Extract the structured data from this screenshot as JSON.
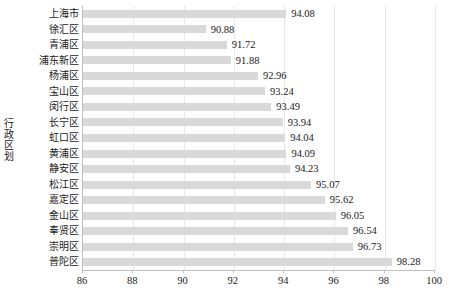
{
  "chart_data": {
    "type": "bar",
    "orientation": "horizontal",
    "title": "",
    "xlabel": "",
    "ylabel": "行政区划",
    "xlim": [
      86,
      100
    ],
    "xticks": [
      86,
      88,
      90,
      92,
      94,
      96,
      98,
      100
    ],
    "grid": true,
    "legend": null,
    "bar_color": "#d9d9d9",
    "categories": [
      "上海市",
      "徐汇区",
      "青浦区",
      "浦东新区",
      "杨浦区",
      "宝山区",
      "闵行区",
      "长宁区",
      "虹口区",
      "黄浦区",
      "静安区",
      "松江区",
      "嘉定区",
      "金山区",
      "奉贤区",
      "崇明区",
      "普陀区"
    ],
    "values": [
      94.08,
      90.88,
      91.72,
      91.88,
      92.96,
      93.24,
      93.49,
      93.94,
      94.04,
      94.09,
      94.23,
      95.07,
      95.62,
      96.05,
      96.54,
      96.73,
      98.28
    ],
    "value_labels": [
      "94.08",
      "90.88",
      "91.72",
      "91.88",
      "92.96",
      "93.24",
      "93.49",
      "93.94",
      "94.04",
      "94.09",
      "94.23",
      "95.07",
      "95.62",
      "96.05",
      "96.54",
      "96.73",
      "98.28"
    ]
  },
  "caption": ""
}
